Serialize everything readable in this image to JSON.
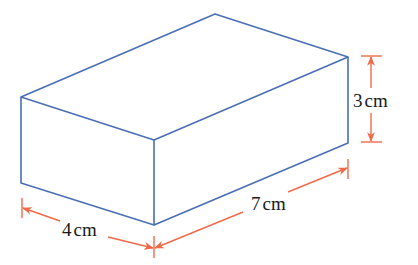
{
  "figure": {
    "shape": "rectangular cuboid",
    "colors": {
      "edge": "#4a6fb5",
      "dimension": "#f06a4a",
      "text": "#1a1a1a",
      "background": "#ffffff"
    },
    "dimensions": {
      "length": {
        "value": 7,
        "unit": "cm",
        "label": "7cm"
      },
      "width": {
        "value": 4,
        "unit": "cm",
        "label": "4cm"
      },
      "height": {
        "value": 3,
        "unit": "cm",
        "label": "3cm"
      }
    },
    "labels": {
      "height_num": "3",
      "height_unit": "cm",
      "length_num": "7",
      "length_unit": "cm",
      "width_num": "4",
      "width_unit": "cm"
    }
  }
}
